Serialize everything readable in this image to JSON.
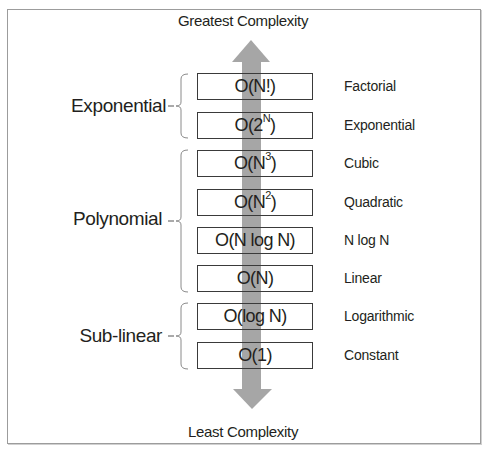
{
  "diagram": {
    "top_label": "Greatest Complexity",
    "bottom_label": "Least Complexity",
    "arrow_color": "#a6a6a6",
    "line_color": "#3a3a3a",
    "items": [
      {
        "base": "O(N!)",
        "pre": "O(N!)",
        "sup": "",
        "post": "",
        "name": "Factorial",
        "group": "Exponential"
      },
      {
        "base": "O(2^N)",
        "pre": "O(2",
        "sup": "N",
        "post": ")",
        "name": "Exponential",
        "group": "Exponential"
      },
      {
        "base": "O(N^3)",
        "pre": "O(N",
        "sup": "3",
        "post": ")",
        "name": "Cubic",
        "group": "Polynomial"
      },
      {
        "base": "O(N^2)",
        "pre": "O(N",
        "sup": "2",
        "post": ")",
        "name": "Quadratic",
        "group": "Polynomial"
      },
      {
        "base": "O(N log N)",
        "pre": "O(N log N)",
        "sup": "",
        "post": "",
        "name": "N log N",
        "group": "Polynomial"
      },
      {
        "base": "O(N)",
        "pre": "O(N)",
        "sup": "",
        "post": "",
        "name": "Linear",
        "group": "Polynomial"
      },
      {
        "base": "O(log N)",
        "pre": "O(log N)",
        "sup": "",
        "post": "",
        "name": "Logarithmic",
        "group": "Sub-linear"
      },
      {
        "base": "O(1)",
        "pre": "O(1)",
        "sup": "",
        "post": "",
        "name": "Constant",
        "group": "Sub-linear"
      }
    ],
    "groups": [
      {
        "label": "Exponential"
      },
      {
        "label": "Polynomial"
      },
      {
        "label": "Sub-linear"
      }
    ]
  }
}
